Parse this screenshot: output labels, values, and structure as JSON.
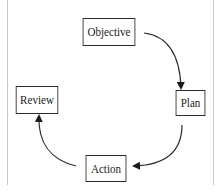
{
  "diagram": {
    "type": "cycle",
    "nodes": [
      {
        "id": "objective",
        "label": "Objective"
      },
      {
        "id": "plan",
        "label": "Plan"
      },
      {
        "id": "action",
        "label": "Action"
      },
      {
        "id": "review",
        "label": "Review"
      }
    ],
    "edges": [
      {
        "from": "objective",
        "to": "plan"
      },
      {
        "from": "plan",
        "to": "action"
      },
      {
        "from": "action",
        "to": "review"
      }
    ],
    "colors": {
      "stroke": "#2a2a2a",
      "background": "#ffffff",
      "frame": "#c8c8c8"
    }
  }
}
